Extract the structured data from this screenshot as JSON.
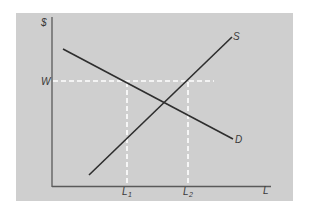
{
  "diagram": {
    "type": "labor market supply and demand with wage floor",
    "colors": {
      "panel_bg": "#cfcfcf",
      "page_bg": "#ffffff",
      "curve": "#2e2e2e",
      "axis": "#5a5a5a",
      "dashed_guides": "#ffffff"
    },
    "axes": {
      "y_label": "$",
      "x_label": "L"
    },
    "curves": [
      {
        "name": "Supply",
        "label": "S",
        "from": [
          89,
          175
        ],
        "to": [
          232,
          37
        ]
      },
      {
        "name": "Demand",
        "label": "D",
        "from": [
          63,
          49
        ],
        "to": [
          233,
          139
        ]
      }
    ],
    "guides": {
      "wage_label": "W",
      "l1_label_main": "L",
      "l1_label_sub": "1",
      "l2_label_main": "L",
      "l2_label_sub": "2"
    }
  }
}
